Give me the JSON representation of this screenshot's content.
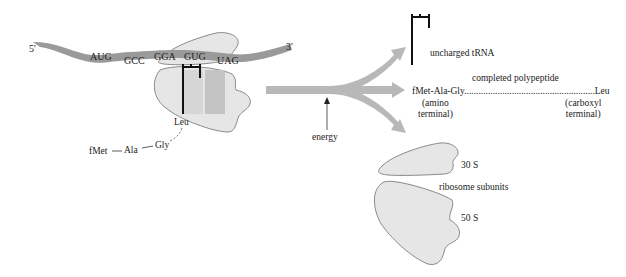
{
  "diagram": {
    "colors": {
      "mrna": "#9a9a9a",
      "ribosome_fill": "#e6e6e6",
      "ribosome_stroke": "#8a8a8a",
      "arrow": "#b8b8b8",
      "trna": "#111111",
      "site_shade": "#c8c8c8"
    },
    "mrna": {
      "five_prime": "5'",
      "three_prime": "3'",
      "codons": [
        "AUG",
        "GCC",
        "GGA",
        "GUG",
        "UAG"
      ]
    },
    "ribosome": {
      "attached_amino_acid": "Leu",
      "chain": [
        "fMet",
        "Ala",
        "Gly"
      ]
    },
    "energy_label": "energy",
    "products": {
      "trna_label": "uncharged tRNA",
      "polypeptide_title": "completed polypeptide",
      "polypeptide_start": "fMet-Ala-Gly",
      "polypeptide_end": "Leu",
      "amino_terminal": [
        "(amino",
        "terminal)"
      ],
      "carboxyl_terminal": [
        "(carboxyl",
        "terminal)"
      ],
      "subunits_label": "ribosome subunits",
      "small_subunit": "30 S",
      "large_subunit": "50 S"
    }
  }
}
